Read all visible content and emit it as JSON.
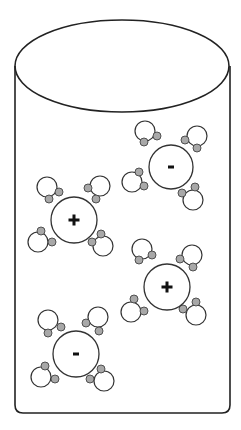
{
  "diagram": {
    "container": {
      "type": "cylinder",
      "top_ellipse": {
        "cx": 122,
        "cy": 66,
        "rx": 107,
        "ry": 46
      },
      "left_x": 15,
      "right_x": 230,
      "bottom_y": 413,
      "corner_radius": 8,
      "stroke": "#222222"
    },
    "colors": {
      "ion_fill": "#ffffff",
      "oxygen_fill": "#ffffff",
      "hydrogen_fill": "#a8a8a8",
      "stroke": "#333333"
    },
    "ions": [
      {
        "id": "ion-top-right",
        "charge": "-",
        "cx": 171,
        "cy": 167,
        "r": 22,
        "waters": [
          {
            "o": [
              145,
              131
            ],
            "h": [
              [
                144,
                142
              ],
              [
                157,
                136
              ]
            ]
          },
          {
            "o": [
              197,
              136
            ],
            "h": [
              [
                185,
                140
              ],
              [
                197,
                148
              ]
            ]
          },
          {
            "o": [
              132,
              182
            ],
            "h": [
              [
                139,
                172
              ],
              [
                144,
                186
              ]
            ]
          },
          {
            "o": [
              193,
              200
            ],
            "h": [
              [
                182,
                193
              ],
              [
                195,
                187
              ]
            ]
          }
        ]
      },
      {
        "id": "ion-middle-left",
        "charge": "+",
        "cx": 74,
        "cy": 220,
        "r": 23,
        "waters": [
          {
            "o": [
              47,
              187
            ],
            "h": [
              [
                49,
                199
              ],
              [
                59,
                192
              ]
            ]
          },
          {
            "o": [
              100,
              186
            ],
            "h": [
              [
                88,
                188
              ],
              [
                96,
                199
              ]
            ]
          },
          {
            "o": [
              38,
              242
            ],
            "h": [
              [
                41,
                231
              ],
              [
                52,
                242
              ]
            ]
          },
          {
            "o": [
              103,
              246
            ],
            "h": [
              [
                92,
                242
              ],
              [
                101,
                234
              ]
            ]
          }
        ]
      },
      {
        "id": "ion-middle-right",
        "charge": "+",
        "cx": 167,
        "cy": 287,
        "r": 23,
        "waters": [
          {
            "o": [
              142,
              249
            ],
            "h": [
              [
                139,
                260
              ],
              [
                152,
                255
              ]
            ]
          },
          {
            "o": [
              192,
              255
            ],
            "h": [
              [
                180,
                259
              ],
              [
                193,
                267
              ]
            ]
          },
          {
            "o": [
              131,
              312
            ],
            "h": [
              [
                134,
                299
              ],
              [
                144,
                311
              ]
            ]
          },
          {
            "o": [
              196,
              315
            ],
            "h": [
              [
                183,
                309
              ],
              [
                196,
                302
              ]
            ]
          }
        ]
      },
      {
        "id": "ion-bottom-left",
        "charge": "-",
        "cx": 76,
        "cy": 354,
        "r": 23,
        "waters": [
          {
            "o": [
              48,
              320
            ],
            "h": [
              [
                48,
                333
              ],
              [
                61,
                327
              ]
            ]
          },
          {
            "o": [
              98,
              317
            ],
            "h": [
              [
                86,
                323
              ],
              [
                99,
                331
              ]
            ]
          },
          {
            "o": [
              41,
              377
            ],
            "h": [
              [
                45,
                366
              ],
              [
                55,
                379
              ]
            ]
          },
          {
            "o": [
              104,
              381
            ],
            "h": [
              [
                90,
                379
              ],
              [
                101,
                369
              ]
            ]
          }
        ]
      }
    ],
    "water_radius": {
      "oxygen": 10,
      "hydrogen": 4
    }
  }
}
